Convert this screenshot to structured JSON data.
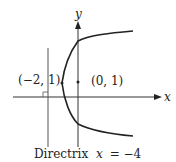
{
  "diagram": {
    "axes": {
      "x_label": "x",
      "y_label": "y"
    },
    "points": [
      {
        "name": "vertex",
        "label": "(−2, 1)"
      },
      {
        "name": "focus",
        "label": "(0, 1)"
      }
    ],
    "directrix": {
      "caption_word": "Directrix",
      "caption_eq_var": "x",
      "caption_eq_rest": "= −4"
    },
    "colors": {
      "curve": "#222222",
      "axes": "#333333",
      "directrix": "#555555"
    }
  }
}
